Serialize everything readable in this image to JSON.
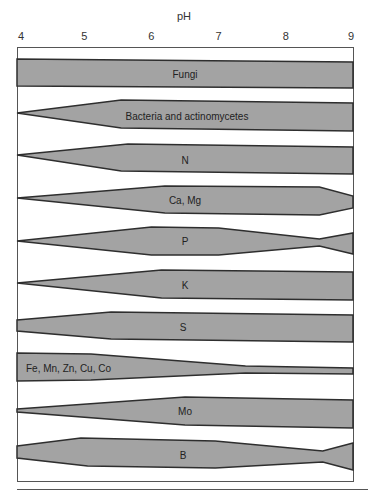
{
  "chart_data": {
    "type": "area",
    "title": "",
    "xlabel": "pH",
    "ylabel": "",
    "xlim": [
      4,
      9
    ],
    "x_ticks": [
      "4",
      "5",
      "6",
      "7",
      "8",
      "9"
    ],
    "grid": false,
    "legend": "none",
    "series": [
      {
        "name": "Fungi",
        "label_pos": {
          "x": 185,
          "y": 74
        },
        "top": [
          [
            4.0,
            59
          ],
          [
            9.0,
            62
          ]
        ],
        "bottom": [
          [
            4.0,
            86
          ],
          [
            9.0,
            88
          ]
        ]
      },
      {
        "name": "Bacteria and actinomycetes",
        "label_pos": {
          "x": 187,
          "y": 116
        },
        "top": [
          [
            4.0,
            113
          ],
          [
            5.55,
            100
          ],
          [
            9.0,
            103
          ]
        ],
        "bottom": [
          [
            4.0,
            113
          ],
          [
            5.55,
            128
          ],
          [
            9.0,
            131
          ]
        ]
      },
      {
        "name": "N",
        "label_pos": {
          "x": 185,
          "y": 160
        },
        "top": [
          [
            4.0,
            155
          ],
          [
            5.65,
            144
          ],
          [
            9.0,
            147
          ]
        ],
        "bottom": [
          [
            4.0,
            155
          ],
          [
            5.55,
            171
          ],
          [
            9.0,
            174
          ]
        ]
      },
      {
        "name": "Ca, Mg",
        "label_pos": {
          "x": 185,
          "y": 200
        },
        "top": [
          [
            4.0,
            198
          ],
          [
            6.2,
            186
          ],
          [
            8.5,
            187
          ],
          [
            9.0,
            196
          ]
        ],
        "bottom": [
          [
            4.0,
            198
          ],
          [
            6.2,
            213
          ],
          [
            8.5,
            215
          ],
          [
            9.0,
            208
          ]
        ]
      },
      {
        "name": "P",
        "label_pos": {
          "x": 185,
          "y": 241
        },
        "top": [
          [
            4.0,
            241
          ],
          [
            6.0,
            227
          ],
          [
            7.0,
            228
          ],
          [
            8.5,
            239
          ],
          [
            9.0,
            233
          ]
        ],
        "bottom": [
          [
            4.0,
            241
          ],
          [
            6.0,
            255
          ],
          [
            7.0,
            255
          ],
          [
            8.5,
            246
          ],
          [
            9.0,
            254
          ]
        ]
      },
      {
        "name": "K",
        "label_pos": {
          "x": 185,
          "y": 285
        },
        "top": [
          [
            4.0,
            283
          ],
          [
            6.15,
            270
          ],
          [
            9.0,
            272
          ]
        ],
        "bottom": [
          [
            4.0,
            283
          ],
          [
            6.15,
            298
          ],
          [
            9.0,
            300
          ]
        ]
      },
      {
        "name": "S",
        "label_pos": {
          "x": 183,
          "y": 327
        },
        "top": [
          [
            4.0,
            320
          ],
          [
            5.4,
            312
          ],
          [
            9.0,
            315
          ]
        ],
        "bottom": [
          [
            4.0,
            331
          ],
          [
            5.4,
            339
          ],
          [
            9.0,
            342
          ]
        ]
      },
      {
        "name": "Fe, Mn, Zn, Cu, Co",
        "label_pos": {
          "x": 26,
          "y": 368
        },
        "label_align": "left",
        "top": [
          [
            4.0,
            353
          ],
          [
            5.1,
            354
          ],
          [
            7.4,
            366
          ],
          [
            9.0,
            368
          ]
        ],
        "bottom": [
          [
            4.0,
            381
          ],
          [
            5.1,
            380
          ],
          [
            7.4,
            373
          ],
          [
            9.0,
            374
          ]
        ]
      },
      {
        "name": "Mo",
        "label_pos": {
          "x": 185,
          "y": 411
        },
        "top": [
          [
            4.0,
            409
          ],
          [
            6.5,
            397
          ],
          [
            9.0,
            400
          ]
        ],
        "bottom": [
          [
            4.0,
            412
          ],
          [
            6.5,
            425
          ],
          [
            9.0,
            428
          ]
        ]
      },
      {
        "name": "B",
        "label_pos": {
          "x": 183,
          "y": 455
        },
        "top": [
          [
            4.0,
            446
          ],
          [
            4.95,
            438
          ],
          [
            6.95,
            441
          ],
          [
            8.55,
            451
          ],
          [
            9.0,
            443
          ]
        ],
        "bottom": [
          [
            4.0,
            458
          ],
          [
            5.05,
            466
          ],
          [
            6.95,
            468
          ],
          [
            8.55,
            462
          ],
          [
            9.0,
            470
          ]
        ]
      }
    ]
  },
  "style": {
    "band_fill": "#a3a3a3",
    "band_stroke": "#2e2e2e",
    "frame_stroke": "#555555"
  }
}
